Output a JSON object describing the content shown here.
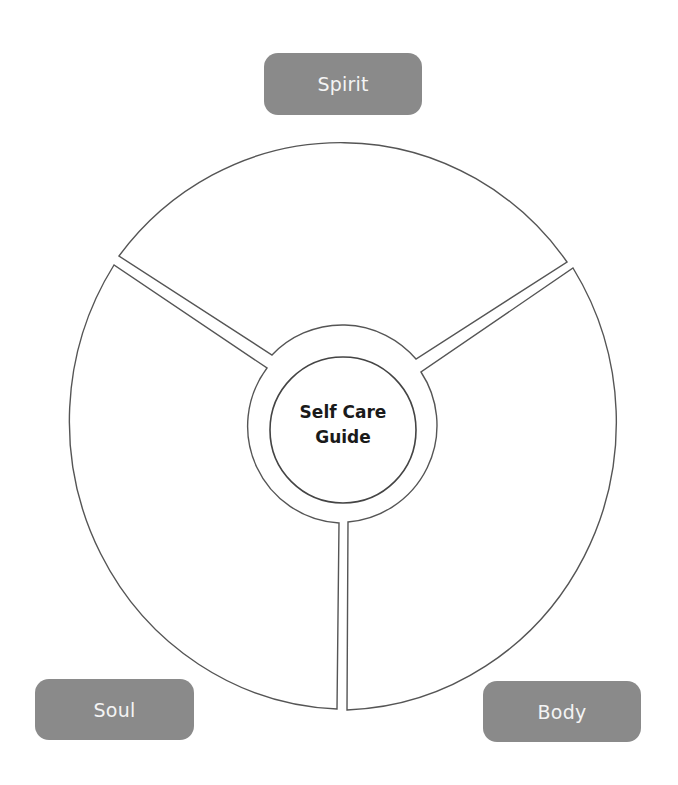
{
  "diagram": {
    "type": "segmented-wheel",
    "center": {
      "line1": "Self Care",
      "line2": "Guide"
    },
    "segments": [
      {
        "id": "spirit",
        "label": "Spirit",
        "position": "top"
      },
      {
        "id": "body",
        "label": "Body",
        "position": "bottom-right"
      },
      {
        "id": "soul",
        "label": "Soul",
        "position": "bottom-left"
      }
    ],
    "colors": {
      "label_fill": "#8a8a8a",
      "label_text": "#f4f4f4",
      "outline": "#555555",
      "center_text": "#1a1a1a",
      "background": "#ffffff"
    }
  }
}
